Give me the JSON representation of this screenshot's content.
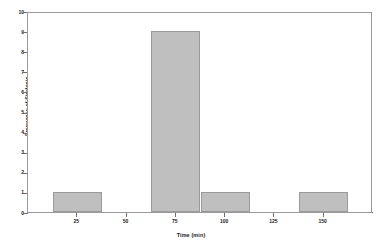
{
  "chart_data": {
    "type": "bar",
    "title": "",
    "subtitle": "",
    "xlabel": "Time (min)",
    "ylabel": "Frequency of Students",
    "xlim": [
      0,
      175
    ],
    "ylim": [
      0,
      10
    ],
    "grid": false,
    "legend": "none",
    "bar_color": "#bfbfbf",
    "bar_edge_color": "#9a9a9a",
    "axis_color": "#6e6e6e",
    "bin_width": 25,
    "bins": [
      {
        "label": "12.5-37.5",
        "start": 12.5,
        "end": 37.5,
        "value": 1
      },
      {
        "label": "37.5-62.5",
        "start": 37.5,
        "end": 62.5,
        "value": 0
      },
      {
        "label": "62.5-87.5",
        "start": 62.5,
        "end": 87.5,
        "value": 9
      },
      {
        "label": "87.5-112.5",
        "start": 87.5,
        "end": 112.5,
        "value": 1
      },
      {
        "label": "112.5-137.5",
        "start": 112.5,
        "end": 137.5,
        "value": 0
      },
      {
        "label": "137.5-162.5",
        "start": 137.5,
        "end": 162.5,
        "value": 1
      }
    ],
    "categories": [
      "12.5-37.5",
      "37.5-62.5",
      "62.5-87.5",
      "87.5-112.5",
      "112.5-137.5",
      "137.5-162.5"
    ],
    "values": [
      1,
      0,
      9,
      1,
      0,
      1
    ],
    "x_ticks": [
      {
        "value": 25,
        "label": "25"
      },
      {
        "value": 50,
        "label": "50"
      },
      {
        "value": 75,
        "label": "75"
      },
      {
        "value": 100,
        "label": "100"
      },
      {
        "value": 125,
        "label": "125"
      },
      {
        "value": 150,
        "label": "150"
      }
    ],
    "y_ticks": [
      {
        "value": 0,
        "label": "0"
      },
      {
        "value": 1,
        "label": "1"
      },
      {
        "value": 2,
        "label": "2"
      },
      {
        "value": 3,
        "label": "3"
      },
      {
        "value": 4,
        "label": "4"
      },
      {
        "value": 5,
        "label": "5"
      },
      {
        "value": 6,
        "label": "6"
      },
      {
        "value": 7,
        "label": "7"
      },
      {
        "value": 8,
        "label": "8"
      },
      {
        "value": 9,
        "label": "9"
      },
      {
        "value": 10,
        "label": "10"
      }
    ]
  }
}
